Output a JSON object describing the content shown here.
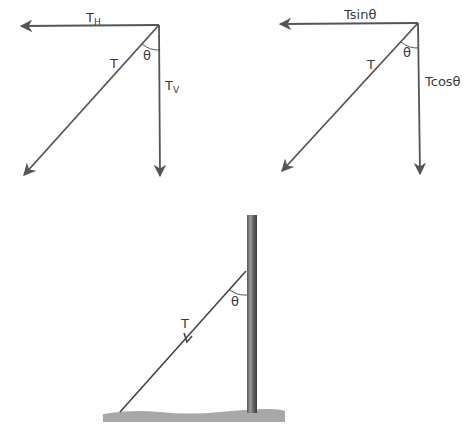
{
  "diagrams": {
    "components_symbolic": {
      "resultant_label": "T",
      "horizontal_label_main": "T",
      "horizontal_label_sub": "H",
      "vertical_label_main": "T",
      "vertical_label_sub": "V",
      "angle_label": "θ"
    },
    "components_trig": {
      "resultant_label": "T",
      "horizontal_label": "Tsinθ",
      "vertical_label": "Tcosθ",
      "angle_label": "θ"
    },
    "pole_with_guy_wire": {
      "tension_label": "T",
      "angle_label": "θ"
    }
  },
  "colors": {
    "line": "#555555",
    "pole_dark": "#4a4a4a",
    "pole_light": "#9a9a9a",
    "ground": "#a8a8a8"
  }
}
